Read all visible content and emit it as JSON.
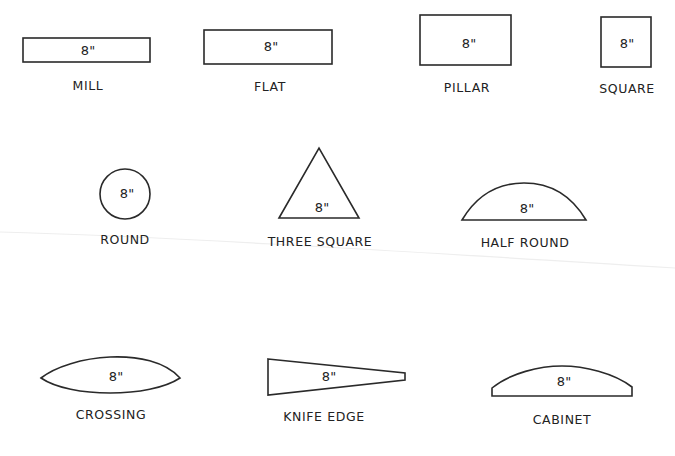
{
  "figure": {
    "dimension_mark": "8\"",
    "colors": {
      "line": "#2a2a2a",
      "text": "#222222",
      "background": "#ffffff"
    },
    "rows": [
      {
        "row": 1,
        "items": [
          {
            "id": "mill",
            "label": "MILL",
            "dimension": "8\"",
            "shape": "thin-rectangle"
          },
          {
            "id": "flat",
            "label": "FLAT",
            "dimension": "8\"",
            "shape": "rectangle"
          },
          {
            "id": "pillar",
            "label": "PILLAR",
            "dimension": "8\"",
            "shape": "thick-rectangle"
          },
          {
            "id": "square",
            "label": "SQUARE",
            "dimension": "8\"",
            "shape": "square"
          }
        ]
      },
      {
        "row": 2,
        "items": [
          {
            "id": "round",
            "label": "ROUND",
            "dimension": "8\"",
            "shape": "circle"
          },
          {
            "id": "three_square",
            "label": "THREE SQUARE",
            "dimension": "8\"",
            "shape": "triangle"
          },
          {
            "id": "half_round",
            "label": "HALF ROUND",
            "dimension": "8\"",
            "shape": "half-round"
          }
        ]
      },
      {
        "row": 3,
        "items": [
          {
            "id": "crossing",
            "label": "CROSSING",
            "dimension": "8\"",
            "shape": "lens"
          },
          {
            "id": "knife_edge",
            "label": "KNIFE EDGE",
            "dimension": "8\"",
            "shape": "wedge"
          },
          {
            "id": "cabinet",
            "label": "CABINET",
            "dimension": "8\"",
            "shape": "shallow-half-round"
          }
        ]
      }
    ]
  }
}
